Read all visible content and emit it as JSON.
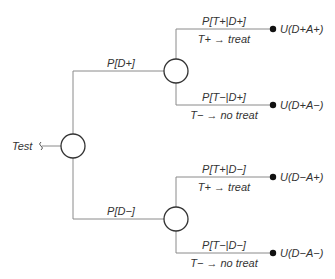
{
  "diagram": {
    "type": "decision-tree",
    "root": {
      "label": "Test",
      "branches": [
        {
          "probability": "P[D+]",
          "chance_node": {
            "branches": [
              {
                "probability": "P[T+|D+]",
                "action": "T+ → treat",
                "utility": "U(D+A+)"
              },
              {
                "probability": "P[T−|D+]",
                "action": "T− → no treat",
                "utility": "U(D+A−)"
              }
            ]
          }
        },
        {
          "probability": "P[D−]",
          "chance_node": {
            "branches": [
              {
                "probability": "P[T+|D−]",
                "action": "T+ → treat",
                "utility": "U(D−A+)"
              },
              {
                "probability": "P[T−|D−]",
                "action": "T− → no treat",
                "utility": "U(D−A−)"
              }
            ]
          }
        }
      ]
    },
    "colors": {
      "line": "#8a8a8a",
      "node_stroke": "#333333",
      "terminal": "#111111",
      "text": "#333333"
    }
  }
}
